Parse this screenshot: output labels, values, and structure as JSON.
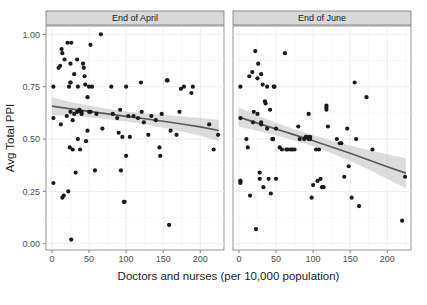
{
  "chart_data": {
    "type": "scatter",
    "title": "",
    "xlabel": "Doctors and nurses (per 10,000 population)",
    "ylabel": "Avg Total PPI",
    "xlim": [
      -8,
      232
    ],
    "ylim": [
      -0.03,
      1.04
    ],
    "xticks": [
      0,
      50,
      100,
      150,
      200
    ],
    "yticks": [
      0.0,
      0.25,
      0.5,
      0.75,
      1.0
    ],
    "xtick_labels": [
      "0",
      "50",
      "100",
      "150",
      "200"
    ],
    "ytick_labels": [
      "0.00",
      "0.25",
      "0.50",
      "0.75",
      "1.00"
    ],
    "grid": true,
    "legend": "none",
    "facet_variable": "period",
    "point_color": "#1a1a1a",
    "point_size": 2.1,
    "line_color": "#595959",
    "band_color": "#bfbfbf",
    "grid_color": "#ebebeb",
    "panel_bg": "#ffffff",
    "strip_bg": "#d9d9d9",
    "facets": [
      {
        "label": "End of April",
        "fit": {
          "type": "loess",
          "x": [
            0,
            25,
            50,
            75,
            100,
            125,
            150,
            175,
            200,
            225
          ],
          "y": [
            0.657,
            0.644,
            0.632,
            0.62,
            0.608,
            0.597,
            0.585,
            0.572,
            0.558,
            0.541
          ],
          "ci_upper": [
            0.7,
            0.677,
            0.66,
            0.645,
            0.632,
            0.623,
            0.616,
            0.608,
            0.6,
            0.592
          ],
          "ci_lower": [
            0.614,
            0.611,
            0.604,
            0.595,
            0.584,
            0.571,
            0.554,
            0.536,
            0.516,
            0.49
          ]
        },
        "points": [
          [
            2,
            0.75
          ],
          [
            2,
            0.6
          ],
          [
            2,
            0.29
          ],
          [
            9,
            0.84
          ],
          [
            11,
            0.85
          ],
          [
            12,
            0.57
          ],
          [
            13,
            0.93
          ],
          [
            14,
            0.91
          ],
          [
            14,
            0.22
          ],
          [
            16,
            0.23
          ],
          [
            17,
            0.88
          ],
          [
            20,
            0.61
          ],
          [
            21,
            0.96
          ],
          [
            22,
            0.25
          ],
          [
            23,
            0.75
          ],
          [
            24,
            0.46
          ],
          [
            25,
            0.86
          ],
          [
            25,
            0.77
          ],
          [
            25,
            0.77
          ],
          [
            25,
            0.63
          ],
          [
            26,
            0.96
          ],
          [
            26,
            0.02
          ],
          [
            28,
            0.59
          ],
          [
            28,
            0.45
          ],
          [
            30,
            0.81
          ],
          [
            30,
            0.62
          ],
          [
            32,
            0.34
          ],
          [
            34,
            0.88
          ],
          [
            34,
            0.63
          ],
          [
            35,
            0.75
          ],
          [
            35,
            0.5
          ],
          [
            37,
            0.64
          ],
          [
            38,
            0.45
          ],
          [
            39,
            0.63
          ],
          [
            40,
            0.63
          ],
          [
            40,
            0.62
          ],
          [
            42,
            0.86
          ],
          [
            43,
            0.84
          ],
          [
            44,
            0.8
          ],
          [
            45,
            0.76
          ],
          [
            46,
            0.49
          ],
          [
            48,
            0.7
          ],
          [
            48,
            0.54
          ],
          [
            50,
            0.75
          ],
          [
            50,
            0.63
          ],
          [
            52,
            0.95
          ],
          [
            52,
            0.63
          ],
          [
            54,
            0.75
          ],
          [
            58,
            0.35
          ],
          [
            60,
            0.62
          ],
          [
            66,
            1.0
          ],
          [
            68,
            0.55
          ],
          [
            80,
            0.75
          ],
          [
            82,
            0.62
          ],
          [
            88,
            0.6
          ],
          [
            90,
            0.53
          ],
          [
            92,
            0.64
          ],
          [
            93,
            0.35
          ],
          [
            95,
            0.51
          ],
          [
            97,
            0.2
          ],
          [
            98,
            0.2
          ],
          [
            100,
            0.42
          ],
          [
            100,
            0.75
          ],
          [
            103,
            0.61
          ],
          [
            105,
            0.51
          ],
          [
            110,
            0.61
          ],
          [
            116,
            0.6
          ],
          [
            120,
            0.77
          ],
          [
            121,
            0.63
          ],
          [
            124,
            0.58
          ],
          [
            130,
            0.52
          ],
          [
            134,
            0.61
          ],
          [
            140,
            0.59
          ],
          [
            145,
            0.46
          ],
          [
            146,
            0.42
          ],
          [
            148,
            0.62
          ],
          [
            155,
            0.78
          ],
          [
            156,
            0.78
          ],
          [
            158,
            0.09
          ],
          [
            160,
            0.54
          ],
          [
            168,
            0.52
          ],
          [
            172,
            0.63
          ],
          [
            174,
            0.74
          ],
          [
            178,
            0.75
          ],
          [
            188,
            0.72
          ],
          [
            190,
            0.75
          ],
          [
            212,
            0.57
          ],
          [
            218,
            0.45
          ],
          [
            224,
            0.52
          ]
        ]
      },
      {
        "label": "End of June",
        "fit": {
          "type": "loess",
          "x": [
            0,
            25,
            50,
            75,
            100,
            125,
            150,
            175,
            200,
            225
          ],
          "y": [
            0.605,
            0.576,
            0.548,
            0.52,
            0.492,
            0.462,
            0.432,
            0.4,
            0.368,
            0.337
          ],
          "ci_upper": [
            0.651,
            0.612,
            0.578,
            0.547,
            0.518,
            0.492,
            0.469,
            0.446,
            0.427,
            0.408
          ],
          "ci_lower": [
            0.559,
            0.54,
            0.518,
            0.493,
            0.466,
            0.432,
            0.395,
            0.354,
            0.309,
            0.266
          ]
        },
        "points": [
          [
            2,
            0.75
          ],
          [
            2,
            0.6
          ],
          [
            2,
            0.3
          ],
          [
            2,
            0.3
          ],
          [
            2,
            0.29
          ],
          [
            10,
            0.5
          ],
          [
            12,
            0.46
          ],
          [
            14,
            0.8
          ],
          [
            15,
            0.23
          ],
          [
            18,
            0.82
          ],
          [
            19,
            0.58
          ],
          [
            20,
            0.63
          ],
          [
            22,
            0.92
          ],
          [
            23,
            0.07
          ],
          [
            25,
            0.79
          ],
          [
            25,
            0.62
          ],
          [
            26,
            0.86
          ],
          [
            28,
            0.31
          ],
          [
            28,
            0.34
          ],
          [
            30,
            0.81
          ],
          [
            30,
            0.58
          ],
          [
            30,
            0.57
          ],
          [
            32,
            0.76
          ],
          [
            33,
            0.27
          ],
          [
            35,
            0.68
          ],
          [
            36,
            0.67
          ],
          [
            38,
            0.75
          ],
          [
            38,
            0.55
          ],
          [
            40,
            0.31
          ],
          [
            42,
            0.64
          ],
          [
            43,
            0.24
          ],
          [
            45,
            0.5
          ],
          [
            46,
            0.5
          ],
          [
            46,
            0.5
          ],
          [
            47,
            0.75
          ],
          [
            48,
            0.75
          ],
          [
            50,
            0.55
          ],
          [
            50,
            0.31
          ],
          [
            55,
            0.46
          ],
          [
            58,
            0.45
          ],
          [
            62,
            0.91
          ],
          [
            64,
            0.45
          ],
          [
            66,
            0.45
          ],
          [
            70,
            0.45
          ],
          [
            72,
            0.45
          ],
          [
            75,
            0.45
          ],
          [
            80,
            0.56
          ],
          [
            82,
            0.5
          ],
          [
            88,
            0.5
          ],
          [
            90,
            0.51
          ],
          [
            92,
            0.51
          ],
          [
            94,
            0.62
          ],
          [
            94,
            0.5
          ],
          [
            96,
            0.51
          ],
          [
            96,
            0.5
          ],
          [
            98,
            0.22
          ],
          [
            100,
            0.28
          ],
          [
            104,
            0.45
          ],
          [
            106,
            0.3
          ],
          [
            108,
            0.45
          ],
          [
            110,
            0.31
          ],
          [
            112,
            0.27
          ],
          [
            114,
            0.27
          ],
          [
            118,
            0.66
          ],
          [
            118,
            0.65
          ],
          [
            118,
            0.64
          ],
          [
            120,
            0.56
          ],
          [
            132,
            0.5
          ],
          [
            136,
            0.48
          ],
          [
            138,
            0.48
          ],
          [
            142,
            0.32
          ],
          [
            146,
            0.55
          ],
          [
            148,
            0.37
          ],
          [
            152,
            0.22
          ],
          [
            156,
            0.77
          ],
          [
            158,
            0.5
          ],
          [
            162,
            0.18
          ],
          [
            172,
            0.7
          ],
          [
            180,
            0.45
          ],
          [
            220,
            0.11
          ],
          [
            224,
            0.32
          ]
        ]
      }
    ]
  },
  "axis": {
    "x_title": "Doctors and nurses (per 10,000 population)",
    "y_title": "Avg Total PPI"
  }
}
